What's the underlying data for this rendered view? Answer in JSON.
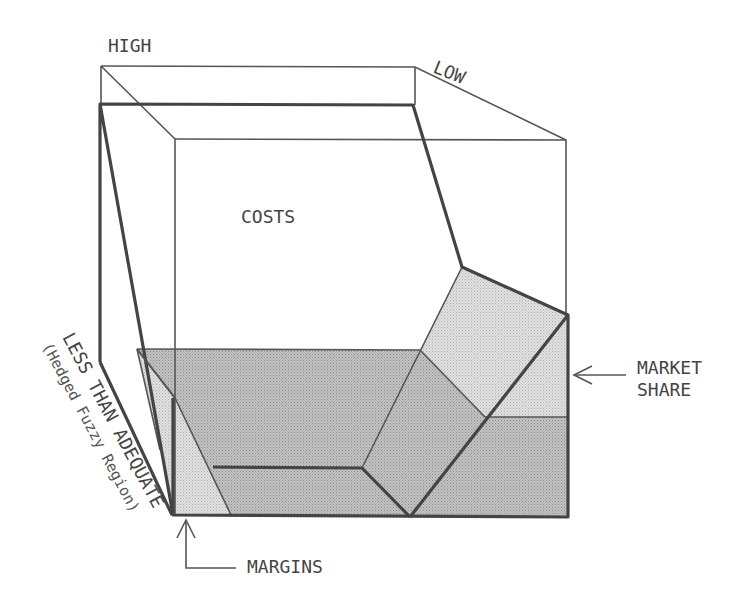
{
  "diagram": {
    "title": "",
    "labels": {
      "high": "HIGH",
      "low": "LOW",
      "costs": "COSTS",
      "market_share_line1": "MARKET",
      "market_share_line2": "SHARE",
      "margins": "MARGINS",
      "less_than_adequate": "LESS THAN ADEQUATE",
      "hedged_fuzzy_region": "(Hedged Fuzzy Region)"
    },
    "colors": {
      "line": "#444444",
      "shade_dark": "#b4b4b4",
      "shade_light": "#d6d6d6",
      "background": "#ffffff"
    }
  }
}
